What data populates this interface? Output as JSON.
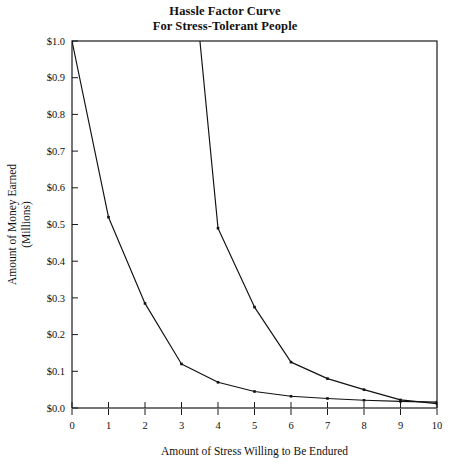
{
  "chart_data": {
    "type": "line",
    "title": "Hassle Factor Curve For Stress-Tolerant People",
    "title_lines": [
      "Hassle Factor Curve",
      "For Stress-Tolerant People"
    ],
    "xlabel": "Amount of Stress Willing to Be Endured",
    "ylabel": "Amount of Money Earned (Millions)",
    "ylabel_lines": [
      "Amount of Money Earned",
      "(Millions)"
    ],
    "x": [
      0,
      1,
      2,
      3,
      4,
      5,
      6,
      7,
      8,
      9,
      10
    ],
    "xlim": [
      0,
      10
    ],
    "ylim": [
      0,
      1
    ],
    "xticks": [
      0,
      1,
      2,
      3,
      4,
      5,
      6,
      7,
      8,
      9,
      10
    ],
    "xtick_labels": [
      "0",
      "1",
      "2",
      "3",
      "4",
      "5",
      "6",
      "7",
      "8",
      "9",
      "10"
    ],
    "yticks": [
      0,
      0.1,
      0.2,
      0.3,
      0.4,
      0.5,
      0.6,
      0.7,
      0.8,
      0.9,
      1
    ],
    "ytick_labels": [
      "$0.0",
      "$0.1",
      "$0.2",
      "$0.3",
      "$0.4",
      "$0.5",
      "$0.6",
      "$0.7",
      "$0.8",
      "$0.9",
      "$1.0"
    ],
    "grid": false,
    "legend": "none",
    "frame": "full-box",
    "series": [
      {
        "name": "lower-curve",
        "values": [
          1.0,
          0.52,
          0.285,
          0.12,
          0.07,
          0.045,
          0.032,
          0.026,
          0.021,
          0.018,
          0.016
        ]
      },
      {
        "name": "upper-curve",
        "clipped_above_axis_max": true,
        "values": [
          null,
          null,
          null,
          1.52,
          0.49,
          0.275,
          0.125,
          0.08,
          0.05,
          0.022,
          0.012
        ]
      }
    ]
  },
  "colors": {
    "line": "#111111",
    "frame": "#1a1a1a",
    "background": "#ffffff"
  }
}
